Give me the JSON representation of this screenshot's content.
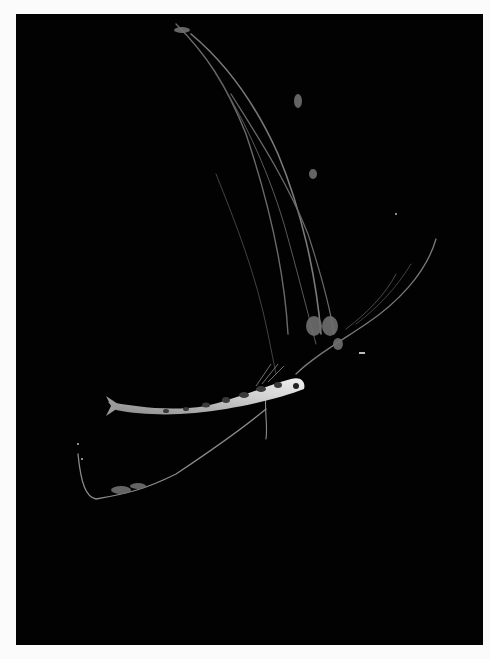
{
  "image": {
    "subject": "larval fish with long trailing filaments on black background",
    "background_color": "#020202",
    "border_color": "#fbfbfb",
    "frame": {
      "left": 16,
      "top": 14,
      "width": 467,
      "height": 631
    }
  }
}
